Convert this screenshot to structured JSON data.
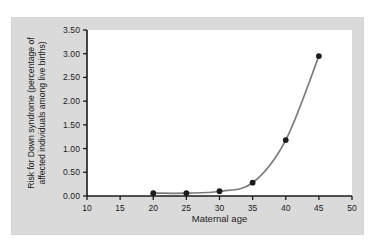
{
  "chart_data": {
    "type": "line",
    "title": "",
    "subtitle": "",
    "xlabel": "Maternal age",
    "ylabel": "Risk for Down syndrome (percentage of affected individuals among live births)",
    "ylabel_line1": "Risk for Down syndrome (percentage of",
    "ylabel_line2": "affected individuals among live births)",
    "xlim": [
      10,
      50
    ],
    "ylim": [
      0.0,
      3.5
    ],
    "xticks": [
      10,
      15,
      20,
      25,
      30,
      35,
      40,
      45,
      50
    ],
    "xtick_labels": [
      "10",
      "15",
      "20",
      "25",
      "30",
      "35",
      "40",
      "45",
      "50"
    ],
    "yticks": [
      0.0,
      0.5,
      1.0,
      1.5,
      2.0,
      2.5,
      3.0,
      3.5
    ],
    "ytick_labels": [
      "0.00",
      "0.50",
      "1.00",
      "1.50",
      "2.00",
      "2.50",
      "3.00",
      "3.50"
    ],
    "grid": false,
    "legend": null,
    "x": [
      20,
      25,
      30,
      35,
      40,
      45
    ],
    "values": [
      0.06,
      0.06,
      0.1,
      0.28,
      1.18,
      2.95
    ],
    "series": [
      {
        "name": "Risk for Down syndrome",
        "x": [
          20,
          25,
          30,
          35,
          40,
          45
        ],
        "values": [
          0.06,
          0.06,
          0.1,
          0.28,
          1.18,
          2.95
        ],
        "line_color": "#7b7b7b",
        "marker_color": "#1c1c1c",
        "marker": "circle"
      }
    ],
    "colors": {
      "figure_background": "#ffffff",
      "panel_background": "#dadada",
      "plot_background": "#ffffff",
      "axis": "#1b1b1b",
      "line": "#7b7b7b",
      "marker": "#1c1c1c",
      "text": "#1b1b1b"
    }
  }
}
